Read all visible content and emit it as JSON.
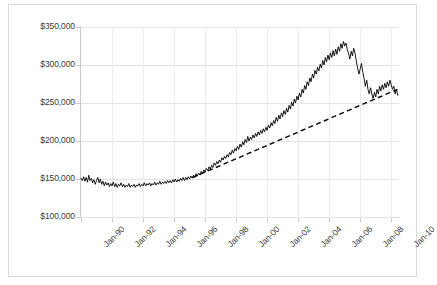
{
  "chart_data": {
    "type": "line",
    "title": "",
    "xlabel": "",
    "ylabel": "",
    "ylim": [
      100000,
      350000
    ],
    "ytick_step": 50000,
    "grid": true,
    "legend": "none",
    "y_ticks": [
      "$100,000",
      "$150,000",
      "$200,000",
      "$250,000",
      "$300,000",
      "$350,000"
    ],
    "y_tick_values": [
      100000,
      150000,
      200000,
      250000,
      300000,
      350000
    ],
    "x_ticks": [
      "Jan-90",
      "Jan-92",
      "Jan-94",
      "Jan-96",
      "Jan-98",
      "Jan-00",
      "Jan-02",
      "Jan-04",
      "Jan-06",
      "Jan-08",
      "Jan-10"
    ],
    "x_tick_values": [
      1990,
      1992,
      1994,
      1996,
      1998,
      2000,
      2002,
      2004,
      2006,
      2008,
      2010
    ],
    "xlim": [
      1990,
      2010.5
    ],
    "series": [
      {
        "name": "Home Price Index",
        "style": "solid",
        "color": "#000000",
        "x": [
          1990.0,
          1990.08,
          1990.17,
          1990.25,
          1990.33,
          1990.42,
          1990.5,
          1990.58,
          1990.67,
          1990.75,
          1990.83,
          1990.92,
          1991.0,
          1991.08,
          1991.17,
          1991.25,
          1991.33,
          1991.42,
          1991.5,
          1991.58,
          1991.67,
          1991.75,
          1991.83,
          1991.92,
          1992.0,
          1992.08,
          1992.17,
          1992.25,
          1992.33,
          1992.42,
          1992.5,
          1992.58,
          1992.67,
          1992.75,
          1992.83,
          1992.92,
          1993.0,
          1993.08,
          1993.17,
          1993.25,
          1993.33,
          1993.42,
          1993.5,
          1993.58,
          1993.67,
          1993.75,
          1993.83,
          1993.92,
          1994.0,
          1994.08,
          1994.17,
          1994.25,
          1994.33,
          1994.42,
          1994.5,
          1994.58,
          1994.67,
          1994.75,
          1994.83,
          1994.92,
          1995.0,
          1995.08,
          1995.17,
          1995.25,
          1995.33,
          1995.42,
          1995.5,
          1995.58,
          1995.67,
          1995.75,
          1995.83,
          1995.92,
          1996.0,
          1996.08,
          1996.17,
          1996.25,
          1996.33,
          1996.42,
          1996.5,
          1996.58,
          1996.67,
          1996.75,
          1996.83,
          1996.92,
          1997.0,
          1997.08,
          1997.17,
          1997.25,
          1997.33,
          1997.42,
          1997.5,
          1997.58,
          1997.67,
          1997.75,
          1997.83,
          1997.92,
          1998.0,
          1998.08,
          1998.17,
          1998.25,
          1998.33,
          1998.42,
          1998.5,
          1998.58,
          1998.67,
          1998.75,
          1998.83,
          1998.92,
          1999.0,
          1999.08,
          1999.17,
          1999.25,
          1999.33,
          1999.42,
          1999.5,
          1999.58,
          1999.67,
          1999.75,
          1999.83,
          1999.92,
          2000.0,
          2000.08,
          2000.17,
          2000.25,
          2000.33,
          2000.42,
          2000.5,
          2000.58,
          2000.67,
          2000.75,
          2000.83,
          2000.92,
          2001.0,
          2001.08,
          2001.17,
          2001.25,
          2001.33,
          2001.42,
          2001.5,
          2001.58,
          2001.67,
          2001.75,
          2001.83,
          2001.92,
          2002.0,
          2002.08,
          2002.17,
          2002.25,
          2002.33,
          2002.42,
          2002.5,
          2002.58,
          2002.67,
          2002.75,
          2002.83,
          2002.92,
          2003.0,
          2003.08,
          2003.17,
          2003.25,
          2003.33,
          2003.42,
          2003.5,
          2003.58,
          2003.67,
          2003.75,
          2003.83,
          2003.92,
          2004.0,
          2004.08,
          2004.17,
          2004.25,
          2004.33,
          2004.42,
          2004.5,
          2004.58,
          2004.67,
          2004.75,
          2004.83,
          2004.92,
          2005.0,
          2005.08,
          2005.17,
          2005.25,
          2005.33,
          2005.42,
          2005.5,
          2005.58,
          2005.67,
          2005.75,
          2005.83,
          2005.92,
          2006.0,
          2006.08,
          2006.17,
          2006.25,
          2006.33,
          2006.42,
          2006.5,
          2006.58,
          2006.67,
          2006.75,
          2006.83,
          2006.92,
          2007.0,
          2007.08,
          2007.17,
          2007.25,
          2007.33,
          2007.42,
          2007.5,
          2007.58,
          2007.67,
          2007.75,
          2007.83,
          2007.92,
          2008.0,
          2008.08,
          2008.17,
          2008.25,
          2008.33,
          2008.42,
          2008.5,
          2008.58,
          2008.67,
          2008.75,
          2008.83,
          2008.92,
          2009.0,
          2009.08,
          2009.17,
          2009.25,
          2009.33,
          2009.42,
          2009.5,
          2009.58,
          2009.67,
          2009.75,
          2009.83,
          2009.92,
          2010.0,
          2010.08,
          2010.17,
          2010.25,
          2010.33,
          2010.42
        ],
        "values": [
          151000,
          148000,
          153000,
          147000,
          152000,
          146000,
          155000,
          148000,
          151000,
          145000,
          149000,
          143000,
          148000,
          152000,
          145000,
          150000,
          143000,
          147000,
          141000,
          146000,
          142000,
          145000,
          140000,
          144000,
          141000,
          146000,
          140000,
          144000,
          139000,
          143000,
          141000,
          145000,
          140000,
          143000,
          139000,
          142000,
          140000,
          144000,
          139000,
          142000,
          140000,
          143000,
          139000,
          142000,
          141000,
          144000,
          140000,
          143000,
          141000,
          145000,
          141000,
          144000,
          142000,
          145000,
          141000,
          144000,
          142000,
          146000,
          142000,
          145000,
          143000,
          147000,
          143000,
          146000,
          144000,
          147000,
          144000,
          148000,
          145000,
          148000,
          145000,
          149000,
          146000,
          150000,
          146000,
          149000,
          147000,
          151000,
          148000,
          152000,
          148000,
          152000,
          149000,
          153000,
          150000,
          154000,
          151000,
          155000,
          152000,
          157000,
          154000,
          158000,
          155000,
          160000,
          157000,
          162000,
          159000,
          164000,
          161000,
          166000,
          163000,
          168000,
          165000,
          171000,
          168000,
          173000,
          170000,
          175000,
          172000,
          178000,
          175000,
          180000,
          177000,
          182000,
          179000,
          185000,
          182000,
          188000,
          184000,
          190000,
          187000,
          193000,
          189000,
          196000,
          192000,
          199000,
          195000,
          202000,
          198000,
          206000,
          200000,
          205000,
          202000,
          208000,
          204000,
          210000,
          206000,
          212000,
          208000,
          214000,
          210000,
          216000,
          212000,
          218000,
          214000,
          221000,
          217000,
          224000,
          220000,
          227000,
          223000,
          231000,
          226000,
          234000,
          229000,
          237000,
          232000,
          240000,
          235000,
          243000,
          238000,
          247000,
          242000,
          251000,
          246000,
          255000,
          250000,
          259000,
          254000,
          263000,
          258000,
          268000,
          263000,
          273000,
          268000,
          278000,
          273000,
          283000,
          278000,
          288000,
          283000,
          293000,
          288000,
          297000,
          292000,
          301000,
          296000,
          306000,
          300000,
          310000,
          304000,
          313000,
          307000,
          316000,
          310000,
          319000,
          312000,
          321000,
          314000,
          324000,
          318000,
          328000,
          322000,
          331000,
          325000,
          329000,
          320000,
          315000,
          308000,
          318000,
          312000,
          322000,
          315000,
          305000,
          296000,
          288000,
          295000,
          302000,
          290000,
          282000,
          272000,
          280000,
          268000,
          262000,
          270000,
          262000,
          256000,
          264000,
          258000,
          268000,
          262000,
          272000,
          266000,
          274000,
          268000,
          276000,
          270000,
          278000,
          272000,
          280000,
          274000,
          268000,
          272000,
          262000,
          268000,
          260000
        ]
      },
      {
        "name": "Linear trend",
        "style": "dashed",
        "color": "#000000",
        "x": [
          1997.2,
          2010.4
        ],
        "values": [
          152000,
          268000
        ]
      }
    ]
  }
}
